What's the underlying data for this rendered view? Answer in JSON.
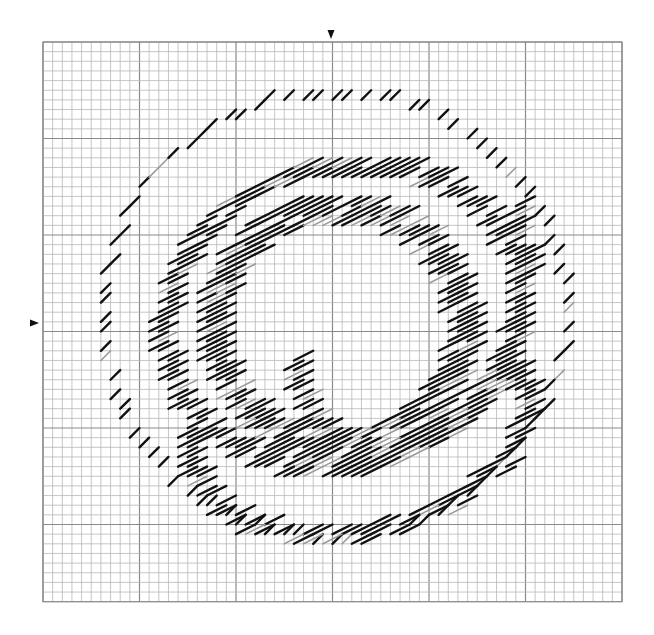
{
  "pattern": {
    "type": "backstitch-chart",
    "grid": {
      "origin_x": 43,
      "origin_y": 42,
      "cell": 9.65,
      "cols": 60,
      "rows": 58,
      "major_every": 10,
      "minor_color": "#b8b8b8",
      "major_color": "#8a8a8a"
    },
    "center_markers": {
      "top": {
        "x": 331,
        "y": 30
      },
      "left": {
        "x": 30,
        "y": 323
      }
    },
    "stitch_colors": {
      "dark": "#111111",
      "light": "#9a9a9a"
    },
    "rings": [
      {
        "name": "outer-ring",
        "cx": 330,
        "cy": 318,
        "rx": 232,
        "ry": 222,
        "rot": -8,
        "width": 1,
        "spacing": 1.6,
        "gaps": [
          0.22,
          0.26
        ]
      },
      {
        "name": "middle-ring",
        "cx": 335,
        "cy": 320,
        "rx": 180,
        "ry": 150,
        "rot": -15,
        "width": 2,
        "spacing": 1.0,
        "gaps": []
      },
      {
        "name": "inner-ring",
        "cx": 330,
        "cy": 330,
        "rx": 125,
        "ry": 118,
        "rot": 0,
        "width": 3,
        "spacing": 1.0,
        "gaps": []
      },
      {
        "name": "lower-loop",
        "cx": 350,
        "cy": 430,
        "rx": 170,
        "ry": 105,
        "rot": -12,
        "width": 2,
        "spacing": 1.0,
        "gaps": [
          0.55,
          0.95
        ]
      },
      {
        "name": "right-swirl",
        "cx": 400,
        "cy": 300,
        "rx": 110,
        "ry": 160,
        "rot": 20,
        "width": 2,
        "spacing": 1.1,
        "gaps": [
          0.4,
          0.85
        ]
      }
    ]
  }
}
